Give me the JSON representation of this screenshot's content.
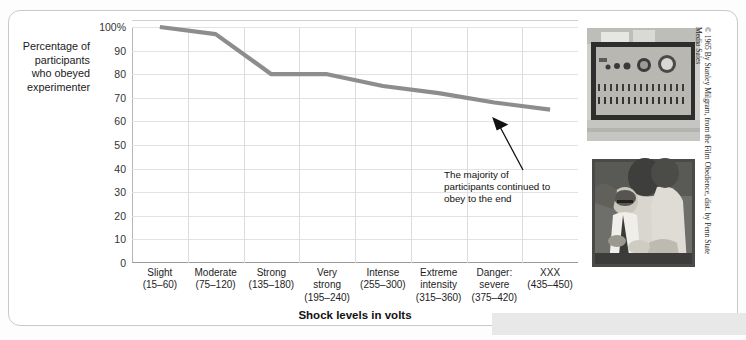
{
  "figure": {
    "y_axis_title": "Percentage\nof participants\nwho obeyed\nexperimenter",
    "x_axis_title": "Shock levels in volts",
    "annotation": "The majority of\nparticipants continued\nto obey to the end",
    "copyright": "© 1965 By Stanley Milgram, from the Film Obedience, dist. by Penn State\nMedia Sales",
    "line_color": "#8d8d8d",
    "grid_color": "#e2e2e2",
    "axis_color": "#9a9a9a"
  },
  "photos": [
    {
      "name": "shock-generator-photo",
      "caption": "Milgram shock generator control panel"
    },
    {
      "name": "learner-strapped-photo",
      "caption": "Experimenter strapping the learner into the chair"
    }
  ],
  "chart_data": {
    "type": "line",
    "title": "",
    "xlabel": "Shock levels in volts",
    "ylabel": "Percentage of participants who obeyed experimenter",
    "ylim": [
      0,
      100
    ],
    "ytick_labels": [
      "100%",
      "90",
      "80",
      "70",
      "60",
      "50",
      "40",
      "30",
      "20",
      "10",
      "0"
    ],
    "ytick_values": [
      100,
      90,
      80,
      70,
      60,
      50,
      40,
      30,
      20,
      10,
      0
    ],
    "grid": true,
    "legend": "none",
    "categories": [
      "Slight\n(15–60)",
      "Moderate\n(75–120)",
      "Strong\n(135–180)",
      "Very\nstrong\n(195–240)",
      "Intense\n(255–300)",
      "Extreme\nintensity\n(315–360)",
      "Danger:\nsevere\n(375–420)",
      "XXX\n(435–450)"
    ],
    "values": [
      100,
      97,
      80,
      80,
      75,
      72,
      68,
      65
    ]
  }
}
